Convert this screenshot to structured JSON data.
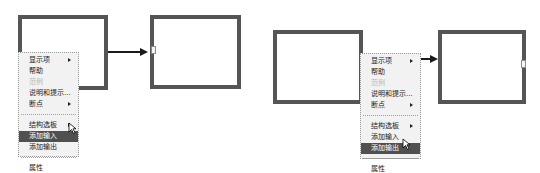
{
  "panels": [
    {
      "id": "left",
      "menu": {
        "items": [
          {
            "label": "显示项",
            "submenu": true,
            "disabled": false,
            "highlighted": false
          },
          {
            "label": "帮助",
            "submenu": false,
            "disabled": false,
            "highlighted": false
          },
          {
            "label": "范例",
            "submenu": false,
            "disabled": true,
            "highlighted": false
          },
          {
            "label": "说明和提示...",
            "submenu": false,
            "disabled": false,
            "highlighted": false
          },
          {
            "label": "断点",
            "submenu": true,
            "disabled": false,
            "highlighted": false
          },
          {
            "label": "结构选板",
            "submenu": true,
            "disabled": false,
            "highlighted": false
          },
          {
            "label": "添加输入",
            "submenu": false,
            "disabled": false,
            "highlighted": true
          },
          {
            "label": "添加输出",
            "submenu": false,
            "disabled": false,
            "highlighted": false
          },
          {
            "label": "属性",
            "submenu": false,
            "disabled": false,
            "highlighted": false
          }
        ]
      }
    },
    {
      "id": "right",
      "menu": {
        "items": [
          {
            "label": "显示项",
            "submenu": true,
            "disabled": false,
            "highlighted": false
          },
          {
            "label": "帮助",
            "submenu": false,
            "disabled": false,
            "highlighted": false
          },
          {
            "label": "范例",
            "submenu": false,
            "disabled": true,
            "highlighted": false
          },
          {
            "label": "说明和提示...",
            "submenu": false,
            "disabled": false,
            "highlighted": false
          },
          {
            "label": "断点",
            "submenu": true,
            "disabled": false,
            "highlighted": false
          },
          {
            "label": "结构选板",
            "submenu": true,
            "disabled": false,
            "highlighted": false
          },
          {
            "label": "添加输入",
            "submenu": false,
            "disabled": false,
            "highlighted": false
          },
          {
            "label": "添加输出",
            "submenu": false,
            "disabled": false,
            "highlighted": true
          },
          {
            "label": "属性",
            "submenu": false,
            "disabled": false,
            "highlighted": false
          }
        ]
      }
    }
  ],
  "colors": {
    "box_border": "#555555",
    "wire": "#1a1a1a",
    "menu_bg": "#f2f2f2",
    "menu_highlight": "#505050",
    "menu_disabled": "#b8b8b8"
  }
}
